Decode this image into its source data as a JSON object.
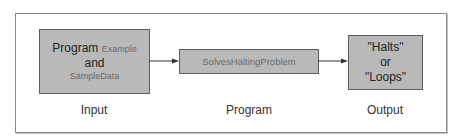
{
  "diagram": {
    "input_box": {
      "line1_plain": "Program",
      "line1_code": "Example",
      "line2": "and",
      "line3_code": "SampleData"
    },
    "program_box": {
      "label": "SolvesHaltingProblem"
    },
    "output_box": {
      "line1": "\"Halts\"",
      "line2": "or",
      "line3": "\"Loops\""
    },
    "captions": {
      "input": "Input",
      "program": "Program",
      "output": "Output"
    },
    "colors": {
      "box_fill": "#b9b9b9",
      "box_border": "#5e5e5e",
      "frame_border": "#8a8a8a",
      "code_text": "#6a6a6a"
    }
  }
}
